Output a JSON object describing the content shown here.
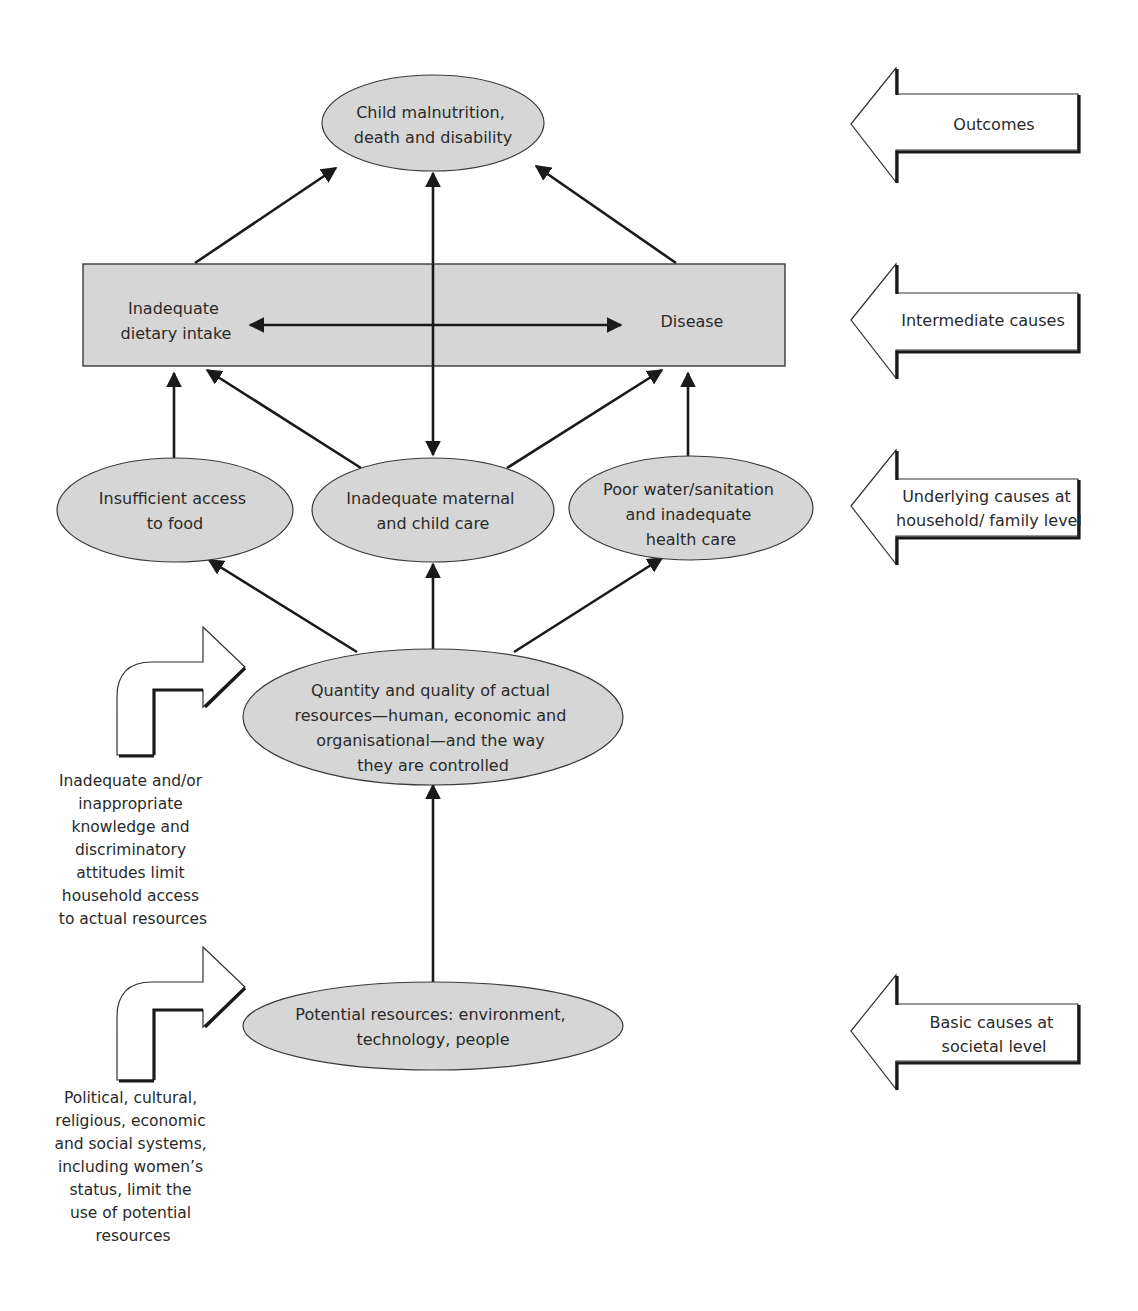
{
  "diagram": {
    "title": "",
    "nodes": {
      "outcome": {
        "lines": [
          "Child malnutrition,",
          "death and disability"
        ]
      },
      "intermediate_left": {
        "lines": [
          "Inadequate",
          "dietary intake"
        ]
      },
      "intermediate_right": {
        "lines": [
          "Disease"
        ]
      },
      "food_access": {
        "lines": [
          "Insufficient access",
          "to food"
        ]
      },
      "maternal_care": {
        "lines": [
          "Inadequate maternal",
          "and child care"
        ]
      },
      "water_health": {
        "lines": [
          "Poor water/sanitation",
          "and inadequate",
          "health care"
        ]
      },
      "actual_resources": {
        "lines": [
          "Quantity and quality of actual",
          "resources—human, economic and",
          "organisational—and the way",
          "they are controlled"
        ]
      },
      "potential_resources": {
        "lines": [
          "Potential resources: environment,",
          "technology, people"
        ]
      }
    },
    "levels": [
      {
        "lines": [
          "Outcomes"
        ]
      },
      {
        "lines": [
          "Intermediate causes"
        ]
      },
      {
        "lines": [
          "Underlying causes at",
          "household/ family level"
        ]
      },
      {
        "lines": [
          "Basic causes at",
          "societal level"
        ]
      }
    ],
    "side_notes": {
      "knowledge": {
        "lines": [
          "Inadequate and/or",
          "inappropriate",
          "knowledge and",
          "discriminatory",
          "attitudes limit",
          "household access",
          "to actual resources"
        ]
      },
      "systems": {
        "lines": [
          "Political, cultural,",
          "religious, economic",
          "and social systems,",
          "including women’s",
          "status, limit the",
          "use of potential",
          "resources"
        ]
      }
    },
    "edges": [
      {
        "from": "intermediate_left",
        "to": "outcome",
        "type": "one-way"
      },
      {
        "from": "intermediate_right",
        "to": "outcome",
        "type": "one-way"
      },
      {
        "from": "maternal_care",
        "to": "outcome",
        "type": "two-way"
      },
      {
        "from": "intermediate_left",
        "to": "intermediate_right",
        "type": "two-way"
      },
      {
        "from": "food_access",
        "to": "intermediate_left",
        "type": "one-way"
      },
      {
        "from": "maternal_care",
        "to": "intermediate_left",
        "type": "one-way"
      },
      {
        "from": "maternal_care",
        "to": "intermediate_right",
        "type": "one-way"
      },
      {
        "from": "water_health",
        "to": "intermediate_right",
        "type": "one-way"
      },
      {
        "from": "actual_resources",
        "to": "food_access",
        "type": "one-way"
      },
      {
        "from": "actual_resources",
        "to": "maternal_care",
        "type": "one-way"
      },
      {
        "from": "actual_resources",
        "to": "water_health",
        "type": "one-way"
      },
      {
        "from": "potential_resources",
        "to": "actual_resources",
        "type": "one-way"
      }
    ]
  }
}
